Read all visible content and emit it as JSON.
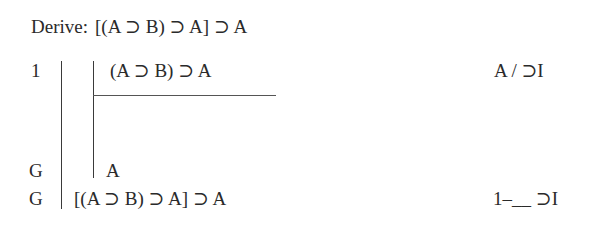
{
  "header": {
    "label": "Derive:",
    "formula": "[(A ⊃ B) ⊃ A] ⊃ A"
  },
  "proof": {
    "lines": [
      {
        "number": "1",
        "formula": "(A ⊃ B) ⊃ A",
        "justification": "A / ⊃I",
        "depth": 2
      },
      {
        "number": "G",
        "formula": "A",
        "justification": "",
        "depth": 2
      },
      {
        "number": "G",
        "formula": "[(A ⊃ B) ⊃ A] ⊃ A",
        "justification": "1–__ ⊃I",
        "depth": 1
      }
    ]
  }
}
